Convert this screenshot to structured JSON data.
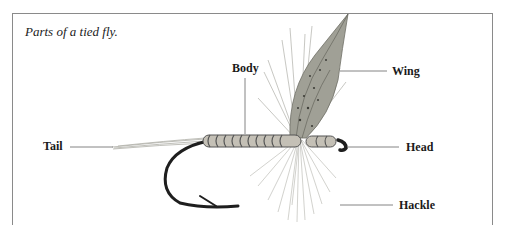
{
  "figure": {
    "caption": "Parts of a tied fly.",
    "labels": {
      "tail": "Tail",
      "body": "Body",
      "wing": "Wing",
      "head": "Head",
      "hackle": "Hackle"
    }
  },
  "colors": {
    "frame": "#8a8a8a",
    "leader_line": "#666666",
    "hook": "#1e1e1e",
    "body_thread": "#b8b4aa",
    "wing": "#9a9a8e",
    "hackle": "#a8a8a0"
  }
}
